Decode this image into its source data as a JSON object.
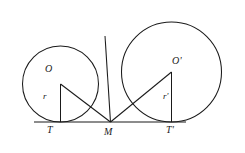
{
  "figure": {
    "type": "geometry-diagram",
    "background_color": "#ffffff",
    "stroke_color": "#1a1a1a",
    "labels": {
      "center_left": "O",
      "center_right": "O'",
      "radius_left": "r",
      "radius_right": "r'",
      "tangent_left": "T",
      "tangent_right": "T'",
      "midpoint": "M"
    }
  },
  "geometry": {
    "baseline": {
      "x1": 34,
      "y1": 122,
      "x2": 186,
      "y2": 122
    },
    "circles": [
      {
        "name": "left-circle",
        "cx": 60.5,
        "cy": 84,
        "r": 38
      },
      {
        "name": "right-circle",
        "cx": 171.5,
        "cy": 72,
        "r": 50
      }
    ],
    "points": {
      "O": {
        "x": 60.5,
        "y": 84
      },
      "Op": {
        "x": 171.5,
        "y": 72
      },
      "T": {
        "x": 60.5,
        "y": 122
      },
      "Tp": {
        "x": 171.5,
        "y": 122
      },
      "M": {
        "x": 110.5,
        "y": 122
      },
      "P": {
        "x": 105.0,
        "y": 36
      }
    },
    "segments": [
      {
        "name": "radius-OT",
        "from": "O",
        "to": "T"
      },
      {
        "name": "radius-OpTp",
        "from": "Op",
        "to": "Tp"
      },
      {
        "name": "chord-OM",
        "from": "O",
        "to": "M"
      },
      {
        "name": "chord-OpM",
        "from": "Op",
        "to": "M"
      },
      {
        "name": "tangent-MP",
        "from": "M",
        "to": "P"
      }
    ],
    "label_positions": {
      "O": {
        "x": 45,
        "y": 70
      },
      "Op": {
        "x": 172,
        "y": 62
      },
      "r": {
        "x": 43,
        "y": 97
      },
      "rp": {
        "x": 163,
        "y": 97
      },
      "T": {
        "x": 48,
        "y": 126
      },
      "Tp": {
        "x": 167,
        "y": 126
      },
      "M": {
        "x": 104,
        "y": 128
      }
    }
  }
}
